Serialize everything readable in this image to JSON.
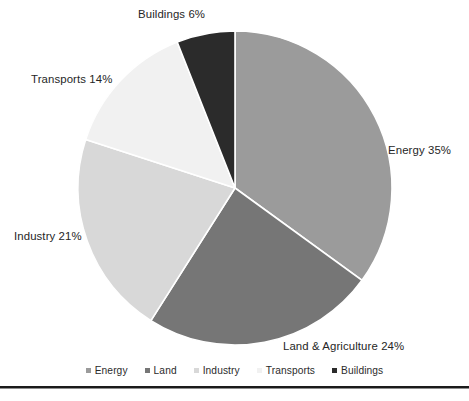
{
  "chart_data": {
    "type": "pie",
    "title": "",
    "subtitle": "",
    "xlabel": "",
    "ylabel": "",
    "grid": false,
    "legend_position": "bottom",
    "start_angle_deg": 0,
    "direction": "clockwise",
    "center": {
      "x": 235,
      "y": 188
    },
    "radius": 157,
    "categories": [
      "Energy",
      "Land",
      "Industry",
      "Transports",
      "Buildings"
    ],
    "values": [
      35,
      24,
      21,
      14,
      6
    ],
    "value_unit": "%",
    "colors": [
      "#9b9b9b",
      "#767676",
      "#d8d8d8",
      "#f1f1f1",
      "#2b2b2b"
    ],
    "slice_separator_color": "#ffffff",
    "slices": [
      {
        "name": "Energy",
        "value": 35,
        "label": "Energy 35%",
        "color": "#9b9b9b"
      },
      {
        "name": "Land",
        "value": 24,
        "label": "Land & Agriculture 24%",
        "color": "#767676"
      },
      {
        "name": "Industry",
        "value": 21,
        "label": "Industry 21%",
        "color": "#d8d8d8"
      },
      {
        "name": "Transports",
        "value": 14,
        "label": "Transports 14%",
        "color": "#f1f1f1"
      },
      {
        "name": "Buildings",
        "value": 6,
        "label": "Buildings 6%",
        "color": "#2b2b2b"
      }
    ],
    "data_labels": [
      "Energy 35%",
      "Land & Agriculture 24%",
      "Industry 21%",
      "Transports 14%",
      "Buildings 6%"
    ],
    "legend_entries": [
      {
        "label": "Energy",
        "color": "#9b9b9b"
      },
      {
        "label": "Land",
        "color": "#767676"
      },
      {
        "label": "Industry",
        "color": "#d8d8d8"
      },
      {
        "label": "Transports",
        "color": "#f1f1f1"
      },
      {
        "label": "Buildings",
        "color": "#2b2b2b"
      }
    ]
  },
  "labels": {
    "energy": "Energy 35%",
    "land": "Land & Agriculture 24%",
    "industry": "Industry 21%",
    "transports": "Transports 14%",
    "buildings": "Buildings 6%"
  },
  "legend": {
    "items": [
      {
        "label": "Energy"
      },
      {
        "label": "Land"
      },
      {
        "label": "Industry"
      },
      {
        "label": "Transports"
      },
      {
        "label": "Buildings"
      }
    ]
  }
}
